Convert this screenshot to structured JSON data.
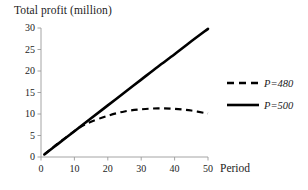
{
  "chart_data": {
    "type": "line",
    "title": "Total profit (million)",
    "xlabel": "Period",
    "ylabel": "Total profit (million)",
    "xlim": [
      0,
      50
    ],
    "ylim": [
      0,
      30
    ],
    "grid": false,
    "legend_position": "right",
    "xticks": [
      "0",
      "10",
      "20",
      "30",
      "40",
      "50"
    ],
    "xtick_values": [
      0,
      10,
      20,
      30,
      40,
      50
    ],
    "yticks": [
      "0",
      "5",
      "10",
      "15",
      "20",
      "25",
      "30"
    ],
    "ytick_values": [
      0,
      5,
      10,
      15,
      20,
      25,
      30
    ],
    "x": [
      1,
      5,
      10,
      12,
      15,
      20,
      25,
      30,
      35,
      40,
      45,
      50
    ],
    "series": [
      {
        "name": "P=480",
        "style": "dashed",
        "color": "#000000",
        "values": [
          0.6,
          3.1,
          6.0,
          7.1,
          8.2,
          9.6,
          10.6,
          11.1,
          11.3,
          11.2,
          10.8,
          10.1
        ]
      },
      {
        "name": "P=500",
        "style": "solid",
        "color": "#000000",
        "values": [
          0.6,
          3.0,
          6.0,
          7.2,
          9.0,
          12.0,
          15.0,
          18.0,
          21.0,
          23.9,
          26.9,
          29.8
        ]
      }
    ]
  },
  "legend": {
    "items": [
      {
        "label": "P=480",
        "style": "dashed"
      },
      {
        "label": "P=500",
        "style": "solid"
      }
    ]
  }
}
